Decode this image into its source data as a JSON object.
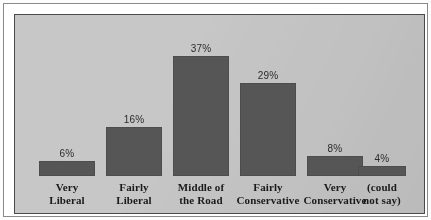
{
  "figure": {
    "panel_background": "#c7c7c7",
    "bar_color": "#565656",
    "frame_color": "#4a4a4a",
    "text_color": "#1a1a1a"
  },
  "chart_data": {
    "type": "bar",
    "title": "",
    "subtitle": "",
    "xlabel": "",
    "ylabel": "",
    "grid": false,
    "legend": "none",
    "ylim": [
      0,
      40
    ],
    "value_suffix": "%",
    "categories": [
      "Very Liberal",
      "Fairly Liberal",
      "Middle of the Road",
      "Fairly Conservative",
      "Very Conservative",
      "(could not say)"
    ],
    "values": [
      6,
      16,
      37,
      29,
      8,
      4
    ],
    "value_labels": [
      "6%",
      "16%",
      "37%",
      "29%",
      "8%",
      "4%"
    ],
    "bars": [
      {
        "value": 6,
        "value_label": "6%",
        "label_lines": [
          "Very",
          "Liberal"
        ],
        "left": 24,
        "width": 56,
        "height": 15
      },
      {
        "value": 16,
        "value_label": "16%",
        "label_lines": [
          "Fairly",
          "Liberal"
        ],
        "left": 91,
        "width": 56,
        "height": 49
      },
      {
        "value": 37,
        "value_label": "37%",
        "label_lines": [
          "Middle of",
          "the Road"
        ],
        "left": 158,
        "width": 56,
        "height": 120
      },
      {
        "value": 29,
        "value_label": "29%",
        "label_lines": [
          "Fairly",
          "Conservative"
        ],
        "left": 225,
        "width": 56,
        "height": 93
      },
      {
        "value": 8,
        "value_label": "8%",
        "label_lines": [
          "Very",
          "Conservative"
        ],
        "left": 292,
        "width": 56,
        "height": 20
      },
      {
        "value": 4,
        "value_label": "4%",
        "label_lines": [
          "(could",
          "not say)"
        ],
        "left": 343,
        "width": 48,
        "height": 10
      }
    ]
  }
}
